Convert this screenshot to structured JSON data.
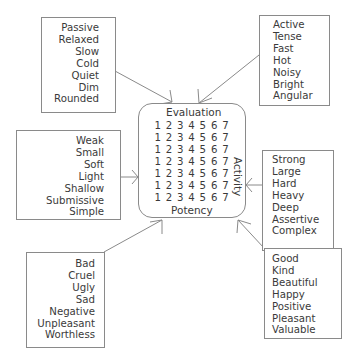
{
  "center": {
    "top_label": "Evaluation",
    "bottom_label": "Potency",
    "side_label": "Activity",
    "scale_rows": [
      [
        "1",
        "2",
        "3",
        "4",
        "5",
        "6",
        "7"
      ],
      [
        "1",
        "2",
        "3",
        "4",
        "5",
        "6",
        "7"
      ],
      [
        "1",
        "2",
        "3",
        "4",
        "5",
        "6",
        "7"
      ],
      [
        "1",
        "2",
        "3",
        "4",
        "5",
        "6",
        "7"
      ],
      [
        "1",
        "2",
        "3",
        "4",
        "5",
        "6",
        "7"
      ],
      [
        "1",
        "2",
        "3",
        "4",
        "5",
        "6",
        "7"
      ],
      [
        "1",
        "2",
        "3",
        "4",
        "5",
        "6",
        "7"
      ]
    ]
  },
  "boxes": {
    "top_left": [
      "Passive",
      "Relaxed",
      "Slow",
      "Cold",
      "Quiet",
      "Dim",
      "Rounded"
    ],
    "top_right": [
      "Active",
      "Tense",
      "Fast",
      "Hot",
      "Noisy",
      "Bright",
      "Angular"
    ],
    "mid_left": [
      "Weak",
      "Small",
      "Soft",
      "Light",
      "Shallow",
      "Submissive",
      "Simple"
    ],
    "mid_right": [
      "Strong",
      "Large",
      "Hard",
      "Heavy",
      "Deep",
      "Assertive",
      "Complex"
    ],
    "bottom_left": [
      "Bad",
      "Cruel",
      "Ugly",
      "Sad",
      "Negative",
      "Unpleasant",
      "Worthless"
    ],
    "bottom_right": [
      "Good",
      "Kind",
      "Beautiful",
      "Happy",
      "Positive",
      "Pleasant",
      "Valuable"
    ]
  },
  "colors": {
    "line": "#8a8a8a",
    "text": "#3a3a3a"
  }
}
